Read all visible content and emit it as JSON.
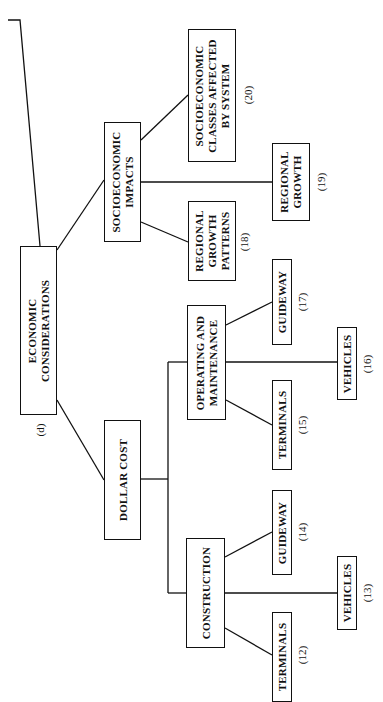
{
  "diagram": {
    "label": "(d)",
    "root": {
      "text": "ECONOMIC\nCONSIDERATIONS"
    },
    "nodes": {
      "socio_impacts": {
        "text": "SOCIOECONOMIC\nIMPACTS"
      },
      "socio_classes": {
        "text": "SOCIOECONOMIC\nCLASSES AFFECTED\nBY SYSTEM",
        "num": "(20)"
      },
      "regional_growth": {
        "text": "REGIONAL\nGROWTH",
        "num": "(19)"
      },
      "regional_patterns": {
        "text": "REGIONAL\nGROWTH\nPATTERNS",
        "num": "(18)"
      },
      "dollar_cost": {
        "text": "DOLLAR COST"
      },
      "operating": {
        "text": "OPERATING AND\nMAINTENANCE"
      },
      "guideway_17": {
        "text": "GUIDEWAY",
        "num": "(17)"
      },
      "terminals_15": {
        "text": "TERMINALS",
        "num": "(15)"
      },
      "vehicles_16": {
        "text": "VEHICLES",
        "num": "(16)"
      },
      "construction": {
        "text": "CONSTRUCTION"
      },
      "guideway_14": {
        "text": "GUIDEWAY",
        "num": "(14)"
      },
      "vehicles_13": {
        "text": "VEHICLES",
        "num": "(13)"
      },
      "terminals_12": {
        "text": "TERMINALS",
        "num": "(12)"
      }
    }
  }
}
